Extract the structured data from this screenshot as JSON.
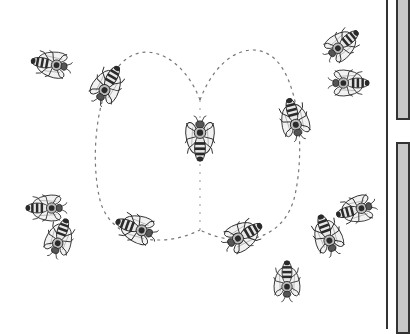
{
  "image": {
    "subject": "Honeybee waggle dance illustration",
    "description": "Central dancing bee with a figure-eight dashed path, surrounded by ten follower bees",
    "colors": {
      "background": "#ffffff",
      "ink": "#2a2a2a",
      "wing": "#f2f2f2",
      "path": "#777777",
      "panel": "#c8c8c8",
      "divider": "#333333"
    }
  },
  "bees": [
    {
      "id": "center",
      "x": 200,
      "y": 140,
      "angle": 0,
      "scale": 1.0
    },
    {
      "id": "top-left-far",
      "x": 50,
      "y": 64,
      "angle": 100,
      "scale": 0.95
    },
    {
      "id": "top-left-near",
      "x": 108,
      "y": 84,
      "angle": 210,
      "scale": 1.0
    },
    {
      "id": "top-right-a",
      "x": 343,
      "y": 44,
      "angle": 230,
      "scale": 0.95
    },
    {
      "id": "top-right-b",
      "x": 350,
      "y": 83,
      "angle": 270,
      "scale": 0.95
    },
    {
      "id": "right-mid",
      "x": 294,
      "y": 118,
      "angle": 165,
      "scale": 1.0
    },
    {
      "id": "left-low-a",
      "x": 45,
      "y": 208,
      "angle": 90,
      "scale": 0.95
    },
    {
      "id": "left-low-b",
      "x": 60,
      "y": 237,
      "angle": 200,
      "scale": 0.95
    },
    {
      "id": "bottom-mid-left",
      "x": 135,
      "y": 228,
      "angle": 110,
      "scale": 1.0
    },
    {
      "id": "bottom-mid-right",
      "x": 244,
      "y": 235,
      "angle": 240,
      "scale": 1.0
    },
    {
      "id": "bottom-center",
      "x": 287,
      "y": 280,
      "angle": 180,
      "scale": 0.95
    },
    {
      "id": "right-low-a",
      "x": 355,
      "y": 210,
      "angle": 75,
      "scale": 0.95
    },
    {
      "id": "right-low-b",
      "x": 327,
      "y": 234,
      "angle": 160,
      "scale": 1.0
    }
  ]
}
